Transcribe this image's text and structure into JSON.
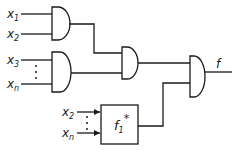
{
  "diagram": {
    "title": "",
    "type": "logic-circuit",
    "inputs": {
      "gate1": [
        {
          "var": "x",
          "sub": "1"
        },
        {
          "var": "x",
          "sub": "2"
        }
      ],
      "gate2": [
        {
          "var": "x",
          "sub": "3"
        },
        {
          "var": "x",
          "sub": "n"
        }
      ],
      "box": [
        {
          "var": "x",
          "sub": "2"
        },
        {
          "var": "x",
          "sub": "n"
        }
      ]
    },
    "box": {
      "label_var": "f",
      "label_sub": "1",
      "label_sup": "*"
    },
    "output": {
      "label": "f"
    },
    "gates": [
      {
        "id": "and1",
        "type": "AND"
      },
      {
        "id": "and2",
        "type": "AND"
      },
      {
        "id": "and3",
        "type": "AND"
      },
      {
        "id": "and4",
        "type": "AND"
      }
    ],
    "colors": {
      "stroke": "#1a1a1a",
      "background": "#ffffff"
    }
  }
}
